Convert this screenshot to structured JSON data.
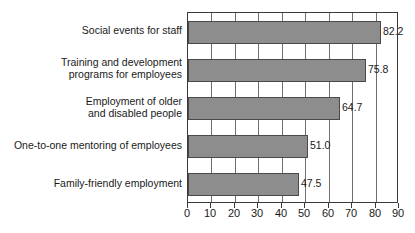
{
  "chart_data": {
    "type": "bar",
    "orientation": "horizontal",
    "title": "",
    "subtitle": "",
    "xlabel": "",
    "ylabel": "",
    "xlim": [
      0,
      90
    ],
    "xticks": [
      0,
      10,
      20,
      30,
      40,
      50,
      60,
      70,
      80,
      90
    ],
    "xtick_labels": [
      "0",
      "10",
      "20",
      "30",
      "40",
      "50",
      "60",
      "70",
      "80",
      "90"
    ],
    "grid": true,
    "grid_axis": "x",
    "legend": false,
    "legend_position": "none",
    "categories": [
      "Social events for staff",
      "Training and development\nprograms for employees",
      "Employment of older\nand disabled people",
      "One-to-one mentoring of employees",
      "Family-friendly employment"
    ],
    "values": [
      82.2,
      75.8,
      64.7,
      51.0,
      47.5
    ],
    "value_labels": [
      "82.2",
      "75.8",
      "64.7",
      "51.0",
      "47.5"
    ],
    "series": [
      {
        "name": "",
        "values": [
          82.2,
          75.8,
          64.7,
          51.0,
          47.5
        ]
      }
    ],
    "colors": {
      "bar_fill": "#8d8d8d",
      "bar_border": "#4a4a4a",
      "gridline": "#6e6e6e",
      "axis": "#3a3a3a",
      "text": "#1a1a1a",
      "background": "#ffffff"
    }
  }
}
